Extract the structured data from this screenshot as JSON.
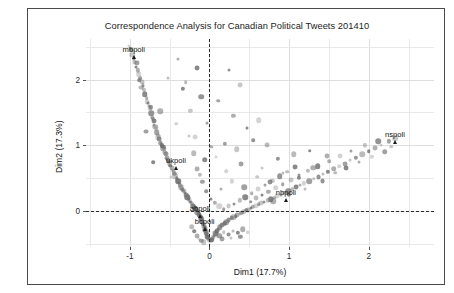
{
  "figure": {
    "background": "#ffffff",
    "frame_color": "#4a4a4a",
    "point_color": "#6e6e6e",
    "zero_line_color": "#2b2b2b",
    "grid_color": "#e9e9e9"
  },
  "chart_data": {
    "type": "scatter",
    "title": "Correspondence Analysis for Canadian Political Tweets 201410",
    "xlabel": "Dim1 (17.7%)",
    "ylabel": "Dim2 (17.3%)",
    "xlim": [
      -1.55,
      2.82
    ],
    "ylim": [
      -0.55,
      2.62
    ],
    "xticks": [
      -1,
      0,
      1,
      2
    ],
    "xticklabels": [
      "-1",
      "0",
      "1",
      "2"
    ],
    "yticks": [
      0,
      1,
      2
    ],
    "yticklabels": [
      "0",
      "1",
      "2"
    ],
    "grid": true,
    "legend": null,
    "reference_lines": [
      {
        "axis": "x",
        "value": 0,
        "style": "dashed"
      },
      {
        "axis": "y",
        "value": 0,
        "style": "dashed"
      }
    ],
    "annotations": [
      {
        "label": "mbpoli",
        "x": -0.95,
        "y": 2.35
      },
      {
        "label": "ukpoli",
        "x": -0.42,
        "y": 0.66
      },
      {
        "label": "abpoli",
        "x": -0.12,
        "y": -0.08
      },
      {
        "label": "bcpoli",
        "x": -0.06,
        "y": -0.27
      },
      {
        "label": "nbpoli",
        "x": 0.96,
        "y": 0.17
      },
      {
        "label": "nspoli",
        "x": 2.33,
        "y": 1.05
      }
    ],
    "series": [
      {
        "name": "terms",
        "points": [
          [
            -1.01,
            2.52
          ],
          [
            -0.99,
            2.46
          ],
          [
            -0.97,
            2.38
          ],
          [
            -0.95,
            2.33
          ],
          [
            -0.94,
            2.27
          ],
          [
            -0.92,
            2.2
          ],
          [
            -0.9,
            2.14
          ],
          [
            -0.89,
            2.08
          ],
          [
            -0.87,
            2.02
          ],
          [
            -0.85,
            1.96
          ],
          [
            -0.84,
            1.9
          ],
          [
            -0.82,
            1.84
          ],
          [
            -0.81,
            1.78
          ],
          [
            -0.79,
            1.72
          ],
          [
            -0.78,
            1.66
          ],
          [
            -0.76,
            1.6
          ],
          [
            -0.75,
            1.55
          ],
          [
            -0.73,
            1.49
          ],
          [
            -0.72,
            1.43
          ],
          [
            -0.7,
            1.37
          ],
          [
            -0.69,
            1.31
          ],
          [
            -0.67,
            1.26
          ],
          [
            -0.66,
            1.2
          ],
          [
            -0.64,
            1.15
          ],
          [
            -0.63,
            1.1
          ],
          [
            -0.61,
            1.05
          ],
          [
            -0.6,
            1.0
          ],
          [
            -0.58,
            0.95
          ],
          [
            -0.57,
            0.9
          ],
          [
            -0.55,
            0.86
          ],
          [
            -0.54,
            0.81
          ],
          [
            -0.52,
            0.77
          ],
          [
            -0.5,
            0.73
          ],
          [
            -0.49,
            0.69
          ],
          [
            -0.47,
            0.65
          ],
          [
            -0.46,
            0.61
          ],
          [
            -0.44,
            0.57
          ],
          [
            -0.43,
            0.53
          ],
          [
            -0.41,
            0.5
          ],
          [
            -0.4,
            0.46
          ],
          [
            -0.38,
            0.43
          ],
          [
            -0.37,
            0.39
          ],
          [
            -0.35,
            0.36
          ],
          [
            -0.34,
            0.33
          ],
          [
            -0.32,
            0.3
          ],
          [
            -0.31,
            0.27
          ],
          [
            -0.29,
            0.24
          ],
          [
            -0.28,
            0.21
          ],
          [
            -0.26,
            0.18
          ],
          [
            -0.25,
            0.16
          ],
          [
            -0.23,
            0.13
          ],
          [
            -0.22,
            0.11
          ],
          [
            -0.21,
            0.08
          ],
          [
            -0.19,
            0.06
          ],
          [
            -0.18,
            0.04
          ],
          [
            -0.17,
            0.02
          ],
          [
            -0.16,
            0.0
          ],
          [
            -0.15,
            -0.02
          ],
          [
            -0.14,
            -0.04
          ],
          [
            -0.13,
            -0.06
          ],
          [
            -0.12,
            -0.08
          ],
          [
            -0.11,
            -0.1
          ],
          [
            -0.1,
            -0.12
          ],
          [
            -0.1,
            -0.14
          ],
          [
            -0.09,
            -0.16
          ],
          [
            -0.08,
            -0.18
          ],
          [
            -0.08,
            -0.2
          ],
          [
            -0.07,
            -0.22
          ],
          [
            -0.06,
            -0.24
          ],
          [
            -0.06,
            -0.26
          ],
          [
            -0.05,
            -0.28
          ],
          [
            -0.05,
            -0.3
          ],
          [
            -0.04,
            -0.32
          ],
          [
            -0.04,
            -0.34
          ],
          [
            -0.03,
            -0.36
          ],
          [
            -0.03,
            -0.38
          ],
          [
            -0.02,
            -0.39
          ],
          [
            -0.02,
            -0.41
          ],
          [
            -0.01,
            -0.42
          ],
          [
            0.0,
            -0.44
          ],
          [
            0.01,
            -0.45
          ],
          [
            0.02,
            -0.46
          ],
          [
            0.03,
            -0.44
          ],
          [
            0.04,
            -0.42
          ],
          [
            0.05,
            -0.4
          ],
          [
            0.06,
            -0.38
          ],
          [
            0.07,
            -0.36
          ],
          [
            0.08,
            -0.34
          ],
          [
            0.09,
            -0.32
          ],
          [
            0.1,
            -0.3
          ],
          [
            0.11,
            -0.28
          ],
          [
            0.12,
            -0.27
          ],
          [
            0.13,
            -0.25
          ],
          [
            0.14,
            -0.23
          ],
          [
            0.16,
            -0.22
          ],
          [
            0.17,
            -0.2
          ],
          [
            0.19,
            -0.19
          ],
          [
            0.21,
            -0.17
          ],
          [
            0.22,
            -0.16
          ],
          [
            0.24,
            -0.14
          ],
          [
            0.26,
            -0.13
          ],
          [
            0.28,
            -0.11
          ],
          [
            0.3,
            -0.1
          ],
          [
            0.33,
            -0.08
          ],
          [
            0.35,
            -0.06
          ],
          [
            0.38,
            -0.05
          ],
          [
            0.4,
            -0.03
          ],
          [
            0.43,
            -0.01
          ],
          [
            0.46,
            0.01
          ],
          [
            0.49,
            0.02
          ],
          [
            0.52,
            0.04
          ],
          [
            0.55,
            0.06
          ],
          [
            0.58,
            0.08
          ],
          [
            0.62,
            0.1
          ],
          [
            0.65,
            0.12
          ],
          [
            0.69,
            0.14
          ],
          [
            0.73,
            0.16
          ],
          [
            0.77,
            0.18
          ],
          [
            0.81,
            0.2
          ],
          [
            0.85,
            0.23
          ],
          [
            0.9,
            0.25
          ],
          [
            0.94,
            0.28
          ],
          [
            0.99,
            0.3
          ],
          [
            1.04,
            0.33
          ],
          [
            1.09,
            0.36
          ],
          [
            1.14,
            0.39
          ],
          [
            1.19,
            0.42
          ],
          [
            1.25,
            0.45
          ],
          [
            1.31,
            0.49
          ],
          [
            1.37,
            0.52
          ],
          [
            1.43,
            0.56
          ],
          [
            1.49,
            0.6
          ],
          [
            1.56,
            0.64
          ],
          [
            1.63,
            0.68
          ],
          [
            1.7,
            0.72
          ],
          [
            1.77,
            0.77
          ],
          [
            1.84,
            0.81
          ],
          [
            1.92,
            0.86
          ],
          [
            2.0,
            0.91
          ],
          [
            2.08,
            0.96
          ],
          [
            2.16,
            1.01
          ],
          [
            2.25,
            1.06
          ],
          [
            2.33,
            1.11
          ],
          [
            -0.88,
            1.99
          ],
          [
            -0.86,
            1.88
          ],
          [
            -0.77,
            1.64
          ],
          [
            -0.71,
            1.4
          ],
          [
            -0.64,
            1.12
          ],
          [
            -0.62,
            1.03
          ],
          [
            -0.56,
            0.88
          ],
          [
            -0.51,
            0.75
          ],
          [
            -0.45,
            0.59
          ],
          [
            -0.39,
            0.45
          ],
          [
            -0.33,
            0.31
          ],
          [
            -0.27,
            0.2
          ],
          [
            -0.24,
            0.14
          ],
          [
            -0.2,
            0.07
          ],
          [
            -0.17,
            0.03
          ],
          [
            -0.13,
            -0.05
          ],
          [
            -0.11,
            -0.11
          ],
          [
            -0.09,
            -0.17
          ],
          [
            -0.07,
            -0.23
          ],
          [
            -0.06,
            -0.29
          ],
          [
            -0.04,
            -0.35
          ],
          [
            -0.03,
            -0.4
          ],
          [
            -0.52,
            2.02
          ],
          [
            -0.33,
            1.86
          ],
          [
            -0.62,
            1.52
          ],
          [
            -0.42,
            1.33
          ],
          [
            -0.8,
            1.21
          ],
          [
            -0.26,
            1.14
          ],
          [
            -0.57,
            0.97
          ],
          [
            -0.2,
            0.88
          ],
          [
            -0.71,
            0.74
          ],
          [
            -0.15,
            0.64
          ],
          [
            -0.48,
            0.52
          ],
          [
            -0.09,
            0.44
          ],
          [
            -0.36,
            0.36
          ],
          [
            -0.04,
            0.3
          ],
          [
            -0.29,
            0.24
          ],
          [
            0.02,
            0.18
          ],
          [
            0.07,
            0.12
          ],
          [
            0.12,
            0.07
          ],
          [
            0.18,
            0.03
          ],
          [
            0.24,
            0.07
          ],
          [
            0.31,
            0.11
          ],
          [
            0.38,
            0.16
          ],
          [
            0.45,
            0.21
          ],
          [
            0.53,
            0.27
          ],
          [
            0.61,
            0.33
          ],
          [
            0.7,
            0.39
          ],
          [
            0.79,
            0.46
          ],
          [
            0.88,
            0.53
          ],
          [
            0.98,
            0.6
          ],
          [
            1.08,
            0.67
          ],
          [
            0.14,
            0.34
          ],
          [
            0.28,
            0.45
          ],
          [
            0.44,
            0.36
          ],
          [
            0.6,
            0.52
          ],
          [
            0.76,
            0.44
          ],
          [
            0.93,
            0.58
          ],
          [
            1.12,
            0.5
          ],
          [
            1.3,
            0.66
          ],
          [
            0.21,
            0.61
          ],
          [
            0.4,
            0.72
          ],
          [
            0.66,
            0.65
          ],
          [
            0.86,
            0.79
          ],
          [
            1.06,
            0.86
          ],
          [
            1.26,
            0.92
          ],
          [
            1.48,
            0.84
          ],
          [
            0.08,
            0.82
          ],
          [
            0.19,
            1.02
          ],
          [
            0.34,
            0.94
          ],
          [
            0.55,
            1.08
          ],
          [
            0.72,
            1.0
          ],
          [
            0.47,
            1.26
          ],
          [
            0.3,
            1.45
          ],
          [
            0.62,
            1.38
          ],
          [
            0.11,
            1.68
          ],
          [
            0.38,
            1.92
          ],
          [
            0.24,
            2.14
          ],
          [
            -0.12,
            0.55
          ],
          [
            -0.06,
            0.78
          ],
          [
            0.02,
            0.98
          ],
          [
            -0.18,
            1.12
          ],
          [
            -0.03,
            1.34
          ],
          [
            -0.24,
            1.52
          ],
          [
            -0.1,
            1.74
          ],
          [
            -0.3,
            1.96
          ],
          [
            -0.16,
            2.18
          ],
          [
            -0.4,
            2.32
          ],
          [
            0.06,
            -0.34
          ],
          [
            0.12,
            -0.38
          ],
          [
            0.18,
            -0.32
          ],
          [
            0.24,
            -0.36
          ],
          [
            0.3,
            -0.3
          ],
          [
            0.36,
            -0.34
          ],
          [
            0.42,
            -0.28
          ],
          [
            0.48,
            -0.32
          ],
          [
            0.16,
            -0.43
          ],
          [
            0.27,
            -0.41
          ],
          [
            0.39,
            -0.39
          ],
          [
            -0.22,
            -0.24
          ],
          [
            -0.19,
            -0.31
          ],
          [
            -0.16,
            -0.38
          ],
          [
            -0.13,
            -0.43
          ],
          [
            -0.1,
            -0.46
          ],
          [
            -0.07,
            -0.48
          ],
          [
            0.52,
            0.14
          ],
          [
            0.58,
            0.19
          ],
          [
            0.66,
            0.24
          ],
          [
            0.74,
            0.29
          ],
          [
            0.83,
            0.35
          ],
          [
            0.92,
            0.41
          ],
          [
            1.02,
            0.47
          ],
          [
            1.13,
            0.54
          ],
          [
            1.24,
            0.61
          ],
          [
            1.36,
            0.68
          ],
          [
            1.5,
            0.76
          ],
          [
            1.64,
            0.84
          ],
          [
            1.78,
            0.92
          ],
          [
            1.95,
            1.0
          ],
          [
            2.12,
            1.06
          ],
          [
            1.58,
            0.58
          ],
          [
            1.72,
            0.66
          ],
          [
            1.88,
            0.74
          ],
          [
            2.04,
            0.82
          ],
          [
            2.2,
            0.9
          ],
          [
            2.28,
            0.98
          ],
          [
            1.42,
            0.46
          ],
          [
            1.2,
            0.34
          ],
          [
            1.0,
            0.24
          ],
          [
            0.8,
            0.15
          ],
          [
            -0.96,
            2.44
          ],
          [
            -0.91,
            2.25
          ],
          [
            -0.83,
            1.93
          ],
          [
            -0.74,
            1.58
          ],
          [
            -0.68,
            1.28
          ],
          [
            -0.59,
            0.99
          ],
          [
            -0.53,
            0.8
          ],
          [
            -0.47,
            0.63
          ]
        ]
      }
    ]
  }
}
